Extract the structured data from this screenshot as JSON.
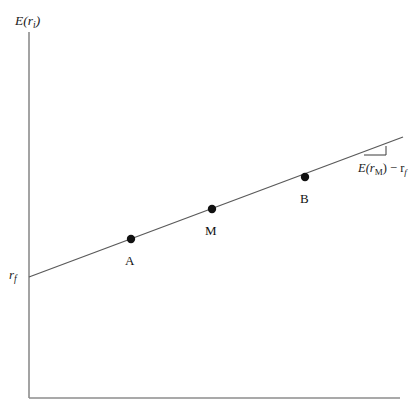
{
  "figure": {
    "title_alt": "Security Market Line diagram",
    "background_color": "#ffffff",
    "axis_color": "#8c8c8c",
    "line_color": "#5a5a5a",
    "marker_color": "#111111",
    "text_color": "#1a1a1a"
  },
  "axes": {
    "y_label": "E(r",
    "y_label_sub": "i",
    "y_label_close": ")",
    "x_label": "",
    "origin_x": 29,
    "origin_y": 398,
    "y_top": 32,
    "x_right": 400
  },
  "intercept": {
    "label": "r",
    "label_sub": "f",
    "y_value": 277
  },
  "sml_line": {
    "name": "security-market-line",
    "x1": 29,
    "y1": 277,
    "x2": 403,
    "y2": 137
  },
  "points": [
    {
      "label": "A",
      "x": 131,
      "y": 239,
      "label_x": 125,
      "label_y": 254
    },
    {
      "label": "M",
      "x": 212,
      "y": 209,
      "label_x": 205,
      "label_y": 224
    },
    {
      "label": "B",
      "x": 305,
      "y": 177,
      "label_x": 300,
      "label_y": 192
    }
  ],
  "slope_annotation": {
    "text_prefix": "E(r",
    "text_sub_m": "M",
    "text_mid": ") − r",
    "text_sub_f": "f",
    "triangle": {
      "ax": 364,
      "ay": 155,
      "bx": 386,
      "by": 155,
      "cx": 386,
      "cy": 146
    },
    "label_x": 358,
    "label_y": 162
  }
}
